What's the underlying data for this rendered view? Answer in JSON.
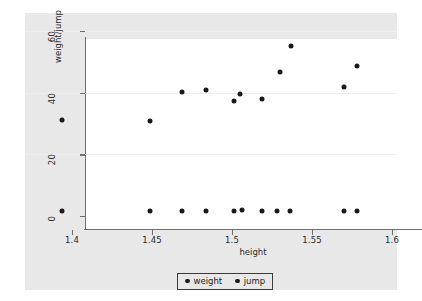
{
  "chart_data": {
    "type": "scatter",
    "title": "",
    "xlabel": "height",
    "ylabel": "weight/jump",
    "xlim": [
      1.3925,
      1.6025
    ],
    "ylim": [
      0,
      62
    ],
    "xticks": [
      "1.4",
      "1.45",
      "1.5",
      "1.55",
      "1.6"
    ],
    "xtick_values": [
      1.4,
      1.45,
      1.5,
      1.55,
      1.6
    ],
    "yticks": [
      "0",
      "20",
      "40",
      "60"
    ],
    "ytick_values": [
      0,
      20,
      40,
      60
    ],
    "grid": "horizontal",
    "legend_position": "bottom",
    "series": [
      {
        "name": "weight",
        "marker": "filled-circle",
        "color": "#1a1a1a",
        "points": [
          {
            "x": 1.394,
            "y": 31.2
          },
          {
            "x": 1.449,
            "y": 30.7
          },
          {
            "x": 1.469,
            "y": 40.1
          },
          {
            "x": 1.484,
            "y": 41.0
          },
          {
            "x": 1.501,
            "y": 37.2
          },
          {
            "x": 1.505,
            "y": 39.6
          },
          {
            "x": 1.519,
            "y": 37.8
          },
          {
            "x": 1.53,
            "y": 46.7
          },
          {
            "x": 1.537,
            "y": 55.0
          },
          {
            "x": 1.57,
            "y": 41.7
          },
          {
            "x": 1.578,
            "y": 48.8
          }
        ]
      },
      {
        "name": "jump",
        "marker": "filled-circle",
        "color": "#1a1a1a",
        "points": [
          {
            "x": 1.394,
            "y": 1.7
          },
          {
            "x": 1.449,
            "y": 1.7
          },
          {
            "x": 1.469,
            "y": 1.7
          },
          {
            "x": 1.484,
            "y": 1.7
          },
          {
            "x": 1.501,
            "y": 1.6
          },
          {
            "x": 1.506,
            "y": 2.1
          },
          {
            "x": 1.519,
            "y": 1.7
          },
          {
            "x": 1.528,
            "y": 1.7
          },
          {
            "x": 1.536,
            "y": 1.6
          },
          {
            "x": 1.57,
            "y": 1.7
          },
          {
            "x": 1.578,
            "y": 1.7
          }
        ]
      }
    ],
    "legend_entries": [
      "weight",
      "jump"
    ]
  },
  "colors": {
    "graph_background": "#e8e8e8",
    "plot_background": "#ffffff",
    "marker": "#1a1a1a",
    "axis": "#6e6e6e",
    "gridline": "#eceff1"
  }
}
